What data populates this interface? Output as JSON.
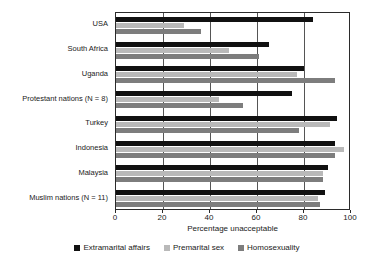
{
  "chart_data": {
    "type": "bar",
    "orientation": "horizontal",
    "title": "",
    "xlabel": "Percentage unacceptable",
    "ylabel": "",
    "xlim": [
      0,
      100
    ],
    "xticks": [
      0,
      20,
      40,
      60,
      80,
      100
    ],
    "xtick_labels": [
      "0",
      "20",
      "40",
      "60",
      "80",
      "100"
    ],
    "grid": true,
    "grid_axis": "x",
    "legend_position": "bottom-center",
    "categories": [
      "USA",
      "South Africa",
      "Uganda",
      "Protestant nations (N = 8)",
      "Turkey",
      "Indonesia",
      "Malaysia",
      "Muslim nations (N = 11)"
    ],
    "series": [
      {
        "name": "Extramarital affairs",
        "color": "#111111",
        "values": [
          84,
          65,
          80,
          75,
          94,
          93,
          90,
          89
        ]
      },
      {
        "name": "Premarital sex",
        "color": "#b9b9b9",
        "values": [
          29,
          48,
          77,
          44,
          91,
          97,
          88,
          86
        ]
      },
      {
        "name": "Homosexuality",
        "color": "#7d7d7d",
        "values": [
          36,
          61,
          93,
          54,
          78,
          93,
          88,
          87
        ]
      }
    ]
  }
}
